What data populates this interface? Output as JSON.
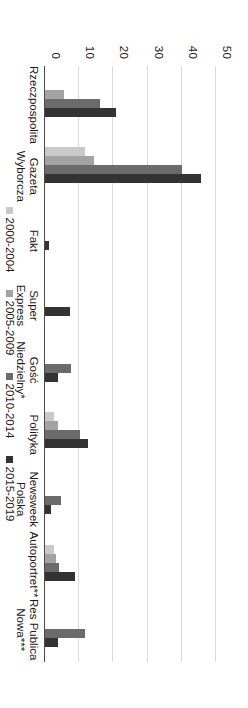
{
  "chart_data": {
    "type": "bar",
    "title": "",
    "subtitle": "",
    "xlabel": "",
    "ylabel": "",
    "ylim": [
      0,
      55
    ],
    "yticks": [
      0,
      10,
      20,
      30,
      40,
      50
    ],
    "ytick_labels": [
      "0",
      "10",
      "20",
      "30",
      "40",
      "50"
    ],
    "grid": true,
    "orientation": "vertical",
    "legend_position": "bottom",
    "categories": [
      "Rzeczpospolita",
      "Gazeta Wyborcza",
      "Fakt",
      "Super Express",
      "Gość Niedzielny*",
      "Polityka",
      "Newsweek Polska",
      "Autoportret**",
      "Res Publica\nNowa***"
    ],
    "series": [
      {
        "name": "2000-2004",
        "color": "#c9c9c9",
        "values": [
          0,
          12,
          0,
          0,
          0,
          3,
          0,
          3,
          0
        ]
      },
      {
        "name": "2005-2009",
        "color": "#a3a3a3",
        "values": [
          6,
          14.5,
          0,
          0,
          0,
          4,
          0,
          3.5,
          0
        ]
      },
      {
        "name": "2010-2014",
        "color": "#6b6b6b",
        "values": [
          16.5,
          40.5,
          0,
          0,
          8,
          10.5,
          5,
          4.5,
          12
        ]
      },
      {
        "name": "2015-2019",
        "color": "#333333",
        "values": [
          21,
          46,
          1.5,
          7.5,
          4,
          13,
          2,
          9,
          4
        ]
      }
    ]
  }
}
